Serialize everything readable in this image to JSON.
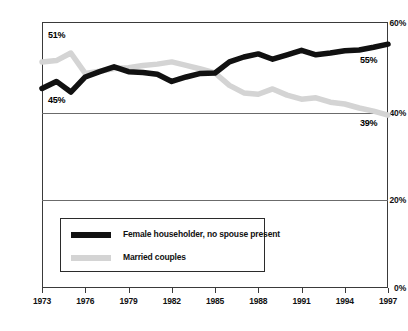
{
  "chart_data": {
    "type": "line",
    "title": "",
    "subtitle": "",
    "xlabel": "",
    "ylabel": "",
    "xlim": [
      1973,
      1997
    ],
    "ylim": [
      0,
      60
    ],
    "grid": true,
    "legend_position": "inside-bottom-left",
    "x": [
      1973,
      1974,
      1975,
      1976,
      1977,
      1978,
      1979,
      1980,
      1981,
      1982,
      1983,
      1984,
      1985,
      1986,
      1987,
      1988,
      1989,
      1990,
      1991,
      1992,
      1993,
      1994,
      1995,
      1996,
      1997
    ],
    "y_ticks": [
      0,
      20,
      40,
      60
    ],
    "y_tick_labels": [
      "0%",
      "20%",
      "40%",
      "60%"
    ],
    "x_ticks": [
      1973,
      1976,
      1979,
      1982,
      1985,
      1988,
      1991,
      1994,
      1997
    ],
    "x_tick_labels": [
      "1973",
      "1976",
      "1979",
      "1982",
      "1985",
      "1988",
      "1991",
      "1994",
      "1997"
    ],
    "series": [
      {
        "name": "Female householder, no spouse present",
        "color": "#111111",
        "values": [
          45.0,
          46.6,
          44.2,
          47.6,
          48.8,
          49.9,
          48.8,
          48.6,
          48.2,
          46.6,
          47.6,
          48.4,
          48.5,
          51.0,
          52.1,
          52.8,
          51.6,
          52.6,
          53.6,
          52.6,
          53.0,
          53.5,
          53.7,
          54.3,
          55.0
        ]
      },
      {
        "name": "Married couples",
        "color": "#d4d4d4",
        "values": [
          51.0,
          51.3,
          53.0,
          48.4,
          48.9,
          49.5,
          49.7,
          50.2,
          50.5,
          51.0,
          50.2,
          49.4,
          48.5,
          45.7,
          44.0,
          43.7,
          44.9,
          43.5,
          42.6,
          42.9,
          41.9,
          41.5,
          40.6,
          39.9,
          39.0
        ]
      }
    ],
    "annotations": [
      {
        "name": "start-married-label",
        "text": "51%",
        "x": 1973,
        "y": 51.0
      },
      {
        "name": "start-female-label",
        "text": "45%",
        "x": 1973,
        "y": 45.0
      },
      {
        "name": "end-female-label",
        "text": "55%",
        "x": 1997,
        "y": 55.0
      },
      {
        "name": "end-married-label",
        "text": "39%",
        "x": 1997,
        "y": 39.0
      }
    ]
  },
  "legend": {
    "items": [
      {
        "label": "Female householder, no spouse present",
        "color": "#111111"
      },
      {
        "label": "Married couples",
        "color": "#d4d4d4"
      }
    ]
  }
}
